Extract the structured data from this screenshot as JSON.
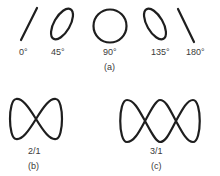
{
  "figure": {
    "panel_a": {
      "caption": "(a)",
      "phase_patterns": [
        {
          "label": "0°",
          "shape": "line-rising"
        },
        {
          "label": "45°",
          "shape": "ellipse-tilted-right"
        },
        {
          "label": "90°",
          "shape": "circle"
        },
        {
          "label": "135°",
          "shape": "ellipse-tilted-left"
        },
        {
          "label": "180°",
          "shape": "line-falling"
        }
      ]
    },
    "panel_b": {
      "caption": "(b)",
      "ratio_label": "2/1",
      "shape": "figure-eight-two-lobes"
    },
    "panel_c": {
      "caption": "(c)",
      "ratio_label": "3/1",
      "shape": "three-lobes"
    }
  }
}
